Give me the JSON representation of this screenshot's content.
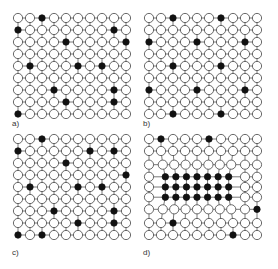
{
  "figure": {
    "grid": {
      "columns": 10,
      "rows": 9
    },
    "colors": {
      "filled": "#111111",
      "empty": "#ffffff",
      "stroke": "#444444",
      "line": "#555555"
    },
    "panels": [
      {
        "label": "a)",
        "origin": [
          18,
          18
        ],
        "spacing": 12,
        "filled": [
          [
            0,
            2
          ],
          [
            1,
            0
          ],
          [
            1,
            8
          ],
          [
            2,
            4
          ],
          [
            2,
            9
          ],
          [
            4,
            1
          ],
          [
            4,
            5
          ],
          [
            4,
            7
          ],
          [
            6,
            3
          ],
          [
            6,
            8
          ],
          [
            7,
            4
          ],
          [
            7,
            8
          ],
          [
            8,
            0
          ]
        ]
      },
      {
        "label": "b)",
        "origin": [
          149,
          18
        ],
        "spacing": 12,
        "filled": [
          [
            0,
            2
          ],
          [
            0,
            6
          ],
          [
            2,
            0
          ],
          [
            2,
            4
          ],
          [
            2,
            8
          ],
          [
            4,
            2
          ],
          [
            4,
            6
          ],
          [
            6,
            0
          ],
          [
            6,
            4
          ],
          [
            6,
            8
          ],
          [
            8,
            2
          ],
          [
            8,
            6
          ]
        ]
      },
      {
        "label": "c)",
        "origin": [
          18,
          139
        ],
        "spacing": 12,
        "filled": [
          [
            0,
            2
          ],
          [
            1,
            0
          ],
          [
            1,
            6
          ],
          [
            1,
            8
          ],
          [
            2,
            4
          ],
          [
            3,
            9
          ],
          [
            4,
            1
          ],
          [
            4,
            5
          ],
          [
            4,
            7
          ],
          [
            6,
            3
          ],
          [
            6,
            8
          ],
          [
            7,
            5
          ],
          [
            7,
            8
          ],
          [
            8,
            0
          ],
          [
            8,
            2
          ]
        ]
      },
      {
        "label": "d)",
        "origin": [
          149,
          139
        ],
        "spacing": 12,
        "filled": [
          [
            0,
            1
          ],
          [
            0,
            5
          ],
          [
            3,
            1
          ],
          [
            3,
            2
          ],
          [
            3,
            3
          ],
          [
            3,
            4
          ],
          [
            3,
            5
          ],
          [
            3,
            6
          ],
          [
            3,
            7
          ],
          [
            4,
            1
          ],
          [
            4,
            2
          ],
          [
            4,
            3
          ],
          [
            4,
            4
          ],
          [
            4,
            5
          ],
          [
            4,
            6
          ],
          [
            4,
            7
          ],
          [
            5,
            1
          ],
          [
            5,
            2
          ],
          [
            5,
            3
          ],
          [
            5,
            4
          ],
          [
            5,
            5
          ],
          [
            5,
            6
          ],
          [
            5,
            7
          ],
          [
            6,
            9
          ],
          [
            7,
            2
          ],
          [
            8,
            7
          ]
        ],
        "cluster": {
          "rows": [
            3,
            4,
            5
          ],
          "cols": [
            1,
            7
          ],
          "compression": 0.85
        }
      }
    ]
  },
  "labels": {
    "a": "a)",
    "b": "b)",
    "c": "c)",
    "d": "d)"
  }
}
